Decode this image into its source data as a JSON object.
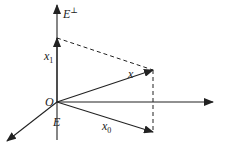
{
  "diagram": {
    "labels": {
      "e_perp": "E",
      "e_perp_sup": "⊥",
      "x1": "x",
      "x1_sub": "1",
      "x": "x",
      "origin": "O",
      "e": "E",
      "x0": "x",
      "x0_sub": "0"
    },
    "colors": {
      "stroke": "#222222",
      "background": "#ffffff"
    }
  }
}
